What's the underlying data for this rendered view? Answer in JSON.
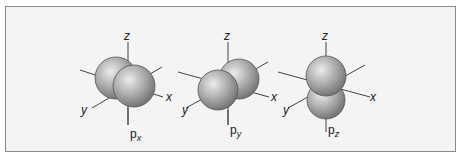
{
  "figure": {
    "orbitals": [
      {
        "name": "px",
        "label_main": "p",
        "label_sub": "x",
        "axes": {
          "z": "z",
          "y": "y",
          "x": "x"
        }
      },
      {
        "name": "py",
        "label_main": "p",
        "label_sub": "y",
        "axes": {
          "z": "z",
          "y": "y",
          "x": "x"
        }
      },
      {
        "name": "pz",
        "label_main": "p",
        "label_sub": "z",
        "axes": {
          "z": "z",
          "y": "y",
          "x": "x"
        }
      }
    ],
    "colors": {
      "lobe": "#9a9a9a",
      "lobe_highlight": "#e6e6e6",
      "axis": "#444444",
      "frame_border": "#8a8a8a",
      "frame_bg": "#f4f4f4"
    }
  }
}
